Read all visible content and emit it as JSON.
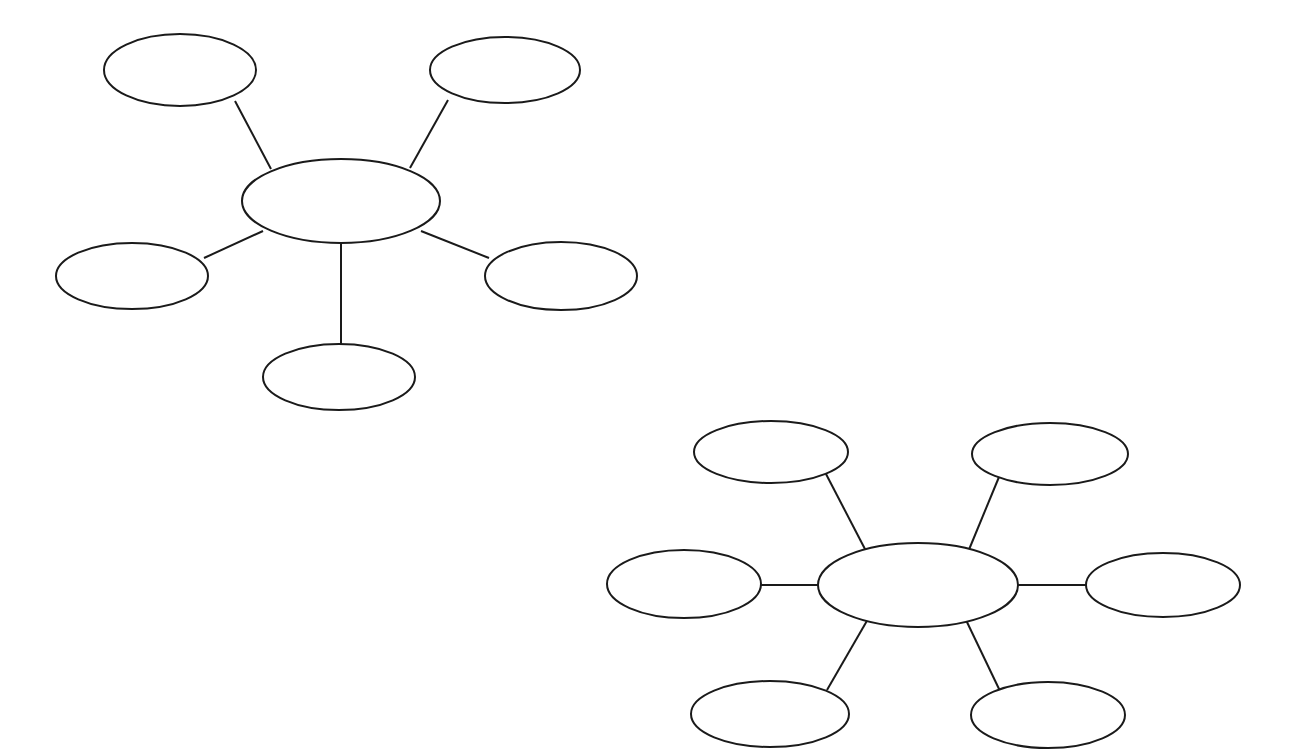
{
  "page": {
    "background_color": "#ffffff",
    "width": 1297,
    "height": 754
  },
  "style": {
    "stroke_color": "#1a1a1a",
    "fill_color": "#ffffff",
    "node_stroke_width": 2,
    "connector_stroke_width": 2
  },
  "chart_data": {
    "type": "diagram",
    "subtype": "node-link bubble map (blank graphic organizer)",
    "diagram_count": 2,
    "diagrams": [
      {
        "id": "bubble-map-1",
        "name": "five-spoke-bubble-map",
        "satellite_count": 5,
        "center": {
          "id": "d1-center",
          "label": "",
          "cx": 341,
          "cy": 201,
          "rx": 99,
          "ry": 42
        },
        "nodes": [
          {
            "id": "d1-node-top-left",
            "label": "",
            "position": "top-left",
            "cx": 180,
            "cy": 70,
            "rx": 76,
            "ry": 36
          },
          {
            "id": "d1-node-top-right",
            "label": "",
            "position": "top-right",
            "cx": 505,
            "cy": 70,
            "rx": 75,
            "ry": 33
          },
          {
            "id": "d1-node-left",
            "label": "",
            "position": "left",
            "cx": 132,
            "cy": 276,
            "rx": 76,
            "ry": 33
          },
          {
            "id": "d1-node-right",
            "label": "",
            "position": "right",
            "cx": 561,
            "cy": 276,
            "rx": 76,
            "ry": 34
          },
          {
            "id": "d1-node-bottom",
            "label": "",
            "position": "bottom",
            "cx": 339,
            "cy": 377,
            "rx": 76,
            "ry": 33
          }
        ],
        "edges": [
          {
            "id": "d1-edge-top-left",
            "from": "d1-node-top-left",
            "to": "d1-center",
            "x1": 235,
            "y1": 101,
            "x2": 271,
            "y2": 169
          },
          {
            "id": "d1-edge-top-right",
            "from": "d1-node-top-right",
            "to": "d1-center",
            "x1": 448,
            "y1": 100,
            "x2": 410,
            "y2": 168
          },
          {
            "id": "d1-edge-left",
            "from": "d1-node-left",
            "to": "d1-center",
            "x1": 204,
            "y1": 258,
            "x2": 263,
            "y2": 231
          },
          {
            "id": "d1-edge-right",
            "from": "d1-node-right",
            "to": "d1-center",
            "x1": 489,
            "y1": 258,
            "x2": 421,
            "y2": 231
          },
          {
            "id": "d1-edge-bottom",
            "from": "d1-node-bottom",
            "to": "d1-center",
            "x1": 341,
            "y1": 344,
            "x2": 341,
            "y2": 243
          }
        ]
      },
      {
        "id": "bubble-map-2",
        "name": "six-spoke-bubble-map",
        "satellite_count": 6,
        "center": {
          "id": "d2-center",
          "label": "",
          "cx": 918,
          "cy": 585,
          "rx": 100,
          "ry": 42
        },
        "nodes": [
          {
            "id": "d2-node-top-left",
            "label": "",
            "position": "top-left",
            "cx": 771,
            "cy": 452,
            "rx": 77,
            "ry": 31
          },
          {
            "id": "d2-node-top-right",
            "label": "",
            "position": "top-right",
            "cx": 1050,
            "cy": 454,
            "rx": 78,
            "ry": 31
          },
          {
            "id": "d2-node-left",
            "label": "",
            "position": "left",
            "cx": 684,
            "cy": 584,
            "rx": 77,
            "ry": 34
          },
          {
            "id": "d2-node-right",
            "label": "",
            "position": "right",
            "cx": 1163,
            "cy": 585,
            "rx": 77,
            "ry": 32
          },
          {
            "id": "d2-node-bottom-left",
            "label": "",
            "position": "bottom-left",
            "cx": 770,
            "cy": 714,
            "rx": 79,
            "ry": 33
          },
          {
            "id": "d2-node-bottom-right",
            "label": "",
            "position": "bottom-right",
            "cx": 1048,
            "cy": 715,
            "rx": 77,
            "ry": 33
          }
        ],
        "edges": [
          {
            "id": "d2-edge-top-left",
            "from": "d2-node-top-left",
            "to": "d2-center",
            "x1": 826,
            "y1": 474,
            "x2": 866,
            "y2": 551
          },
          {
            "id": "d2-edge-top-right",
            "from": "d2-node-top-right",
            "to": "d2-center",
            "x1": 999,
            "y1": 477,
            "x2": 968,
            "y2": 552
          },
          {
            "id": "d2-edge-left",
            "from": "d2-node-left",
            "to": "d2-center",
            "x1": 760,
            "y1": 585,
            "x2": 818,
            "y2": 585
          },
          {
            "id": "d2-edge-right",
            "from": "d2-node-right",
            "to": "d2-center",
            "x1": 1018,
            "y1": 585,
            "x2": 1086,
            "y2": 585
          },
          {
            "id": "d2-edge-bottom-left",
            "from": "d2-node-bottom-left",
            "to": "d2-center",
            "x1": 827,
            "y1": 690,
            "x2": 868,
            "y2": 619
          },
          {
            "id": "d2-edge-bottom-right",
            "from": "d2-node-bottom-right",
            "to": "d2-center",
            "x1": 1000,
            "y1": 691,
            "x2": 966,
            "y2": 620
          }
        ]
      }
    ]
  }
}
